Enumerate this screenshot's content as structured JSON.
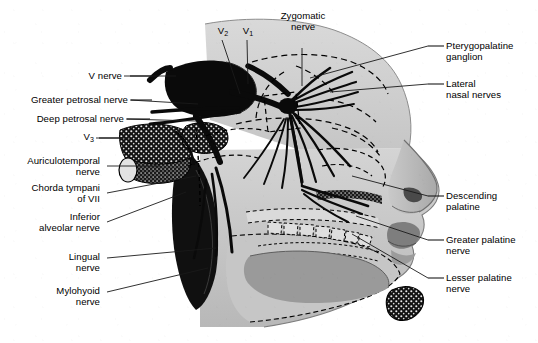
{
  "figure": {
    "background_color": "#ffffff",
    "ink_color": "#000000",
    "tissue_gray_light": "#cfcfcf",
    "tissue_gray_mid": "#b4b4b4",
    "tissue_gray_dark": "#8f8f8f",
    "bone_black": "#111111"
  },
  "labels": {
    "left": [
      {
        "id": "v-nerve",
        "text": "V nerve",
        "sub": ""
      },
      {
        "id": "greater-petrosal",
        "text": "Greater petrosal nerve",
        "sub": ""
      },
      {
        "id": "deep-petrosal",
        "text": "Deep petrosal nerve",
        "sub": ""
      },
      {
        "id": "v3",
        "text": "V",
        "sub": "3"
      },
      {
        "id": "auriculotemporal",
        "line1": "Auriculotemporal",
        "line2": "nerve"
      },
      {
        "id": "chorda-tympani",
        "line1": "Chorda tympani",
        "line2": "of VII"
      },
      {
        "id": "inferior-alveolar",
        "line1": "Inferior",
        "line2": "alveolar nerve"
      },
      {
        "id": "lingual",
        "line1": "Lingual",
        "line2": "nerve"
      },
      {
        "id": "mylohyoid",
        "line1": "Mylohyoid",
        "line2": "nerve"
      }
    ],
    "top": [
      {
        "id": "v2",
        "text": "V",
        "sub": "2"
      },
      {
        "id": "v1",
        "text": "V",
        "sub": "1"
      },
      {
        "id": "zygomatic",
        "line1": "Zygomatic",
        "line2": "nerve"
      }
    ],
    "right": [
      {
        "id": "pterygopalatine-ganglion",
        "line1": "Pterygopalatine",
        "line2": "ganglion"
      },
      {
        "id": "lateral-nasal",
        "line1": "Lateral",
        "line2": "nasal nerves"
      },
      {
        "id": "descending-palatine",
        "line1": "Descending",
        "line2": "palatine"
      },
      {
        "id": "greater-palatine",
        "line1": "Greater palatine",
        "line2": "nerve"
      },
      {
        "id": "lesser-palatine",
        "line1": "Lesser palatine",
        "line2": "nerve"
      }
    ]
  },
  "label_text": {
    "v_nerve": "V nerve",
    "greater_petrosal_nerve": "Greater petrosal nerve",
    "deep_petrosal_nerve": "Deep petrosal nerve",
    "v3_base": "V",
    "v3_sub": "3",
    "v2_base": "V",
    "v2_sub": "2",
    "v1_base": "V",
    "v1_sub": "1",
    "auriculotemporal_1": "Auriculotemporal",
    "auriculotemporal_2": "nerve",
    "chorda_tympani_1": "Chorda tympani",
    "chorda_tympani_2": "of VII",
    "inferior_alveolar_1": "Inferior",
    "inferior_alveolar_2": "alveolar nerve",
    "lingual_1": "Lingual",
    "lingual_2": "nerve",
    "mylohyoid_1": "Mylohyoid",
    "mylohyoid_2": "nerve",
    "zygomatic_1": "Zygomatic",
    "zygomatic_2": "nerve",
    "pterygopalatine_1": "Pterygopalatine",
    "pterygopalatine_2": "ganglion",
    "lateral_nasal_1": "Lateral",
    "lateral_nasal_2": "nasal nerves",
    "descending_palatine_1": "Descending",
    "descending_palatine_2": "palatine",
    "greater_palatine_1": "Greater palatine",
    "greater_palatine_2": "nerve",
    "lesser_palatine_1": "Lesser palatine",
    "lesser_palatine_2": "nerve"
  }
}
